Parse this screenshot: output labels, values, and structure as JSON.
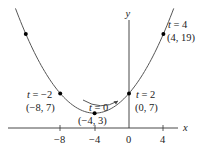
{
  "chart_data": {
    "type": "line",
    "title": "",
    "xlabel": "x",
    "ylabel": "y",
    "parametric": "x = 2t - 4, y = t^2 + 3",
    "x_ticks": [
      "-8",
      "-4",
      "0",
      "4"
    ],
    "x_tick_values": [
      -8,
      -4,
      0,
      4
    ],
    "xlim": [
      -14,
      8
    ],
    "ylim": [
      0,
      23
    ],
    "grid": false,
    "legend": "none",
    "curve_points": [
      {
        "t": -5,
        "x": -14,
        "y": 28
      },
      {
        "t": -4,
        "x": -12,
        "y": 19
      },
      {
        "t": -2,
        "x": -8,
        "y": 7
      },
      {
        "t": 0,
        "x": -4,
        "y": 3
      },
      {
        "t": 2,
        "x": 0,
        "y": 7
      },
      {
        "t": 4,
        "x": 4,
        "y": 19
      },
      {
        "t": 5,
        "x": 6,
        "y": 28
      }
    ],
    "marked_points": [
      {
        "x": -12,
        "y": 19,
        "label_t": "",
        "label_xy": ""
      },
      {
        "x": -8,
        "y": 7,
        "label_t": "t = −2",
        "label_xy": "(−8, 7)"
      },
      {
        "x": -4,
        "y": 3,
        "label_t": "t = 0",
        "label_xy": "(−4, 3)"
      },
      {
        "x": 0,
        "y": 7,
        "label_t": "t = 2",
        "label_xy": "(0, 7)"
      },
      {
        "x": 4,
        "y": 19,
        "label_t": "t = 4",
        "label_xy": "(4, 19)"
      }
    ],
    "annotations": [
      "direction arrow indicating increasing t (left to right)"
    ]
  },
  "labels": {
    "x_axis": "x",
    "y_axis": "y",
    "tick_m8": "−8",
    "tick_m4": "−4",
    "tick_0": "0",
    "tick_4": "4",
    "p_m2_t": "t = −2",
    "p_m2_xy": "(−8, 7)",
    "p_0_t": "t = 0",
    "p_0_xy": "(−4, 3)",
    "p_2_t": "t = 2",
    "p_2_xy": "(0, 7)",
    "p_4_t": "t = 4",
    "p_4_xy": "(4, 19)"
  },
  "colors": {
    "curve": "#555555",
    "axis": "#333333",
    "point": "#000000"
  }
}
